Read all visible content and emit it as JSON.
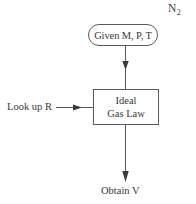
{
  "diagram": {
    "background_color": "#ffffff",
    "stroke_color": "#5a5a5a",
    "text_color": "#383838",
    "species": {
      "base": "N",
      "subscript": "2",
      "full": "N2"
    },
    "nodes": {
      "start": {
        "shape": "rounded-rectangle",
        "label": "Given M, P, T"
      },
      "process": {
        "shape": "rectangle",
        "line1": "Ideal",
        "line2": "Gas Law"
      },
      "input_label": {
        "shape": "text",
        "label": "Look up R"
      },
      "output_label": {
        "shape": "text",
        "label": "Obtain V"
      }
    },
    "connectors": [
      {
        "name": "start-to-process",
        "direction": "down"
      },
      {
        "name": "lookup-to-process",
        "direction": "right"
      },
      {
        "name": "process-to-result",
        "direction": "down"
      }
    ]
  }
}
